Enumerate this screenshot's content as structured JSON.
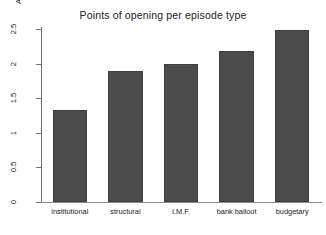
{
  "chart_data": {
    "type": "bar",
    "title": "Points of opening per episode type",
    "xlabel": "",
    "ylabel": "Average number of openings",
    "categories": [
      "institutional",
      "structural",
      "I.M.F.",
      "bank bailout",
      "budgetary"
    ],
    "values": [
      1.33,
      1.9,
      1.99,
      2.18,
      2.48
    ],
    "ylim": [
      0,
      2.5
    ],
    "yticks": [
      "0",
      "0.5",
      "1",
      "1.5",
      "2",
      "2.5"
    ],
    "ytick_values": [
      0,
      0.5,
      1,
      1.5,
      2,
      2.5
    ],
    "grid": false,
    "legend": null,
    "bar_color": "#4b4b4b",
    "background_color": "#ffffff",
    "axis_color": "#6e6e6e"
  }
}
